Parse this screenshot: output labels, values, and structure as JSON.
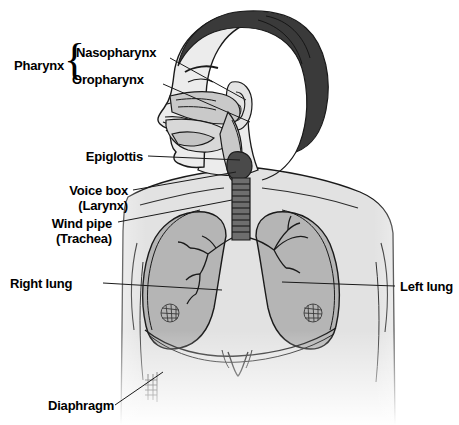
{
  "figure": {
    "background_color": "#ffffff",
    "ink_color": "#1a1a1a",
    "skin_color": "#e9e9e9",
    "hair_color": "#3a3a3a",
    "lung_color": "#b5b5b5",
    "airway_color": "#c9c9c9",
    "trachea_color": "#555555"
  },
  "labels": {
    "pharynx": "Pharynx",
    "nasopharynx": "Nasopharynx",
    "oropharynx": "Oropharynx",
    "epiglottis": "Epiglottis",
    "voice_box_line1": "Voice box",
    "voice_box_line2": "(Larynx)",
    "wind_pipe_line1": "Wind pipe",
    "wind_pipe_line2": "(Trachea)",
    "right_lung": "Right lung",
    "left_lung": "Left lung",
    "diaphragm": "Diaphragm",
    "brace_glyph": "{"
  },
  "parts": [
    {
      "name": "nasal-cavity",
      "label": "Nasopharynx"
    },
    {
      "name": "oral-cavity",
      "label": "Oropharynx"
    },
    {
      "name": "epiglottis",
      "label": "Epiglottis"
    },
    {
      "name": "larynx",
      "label": "Voice box (Larynx)"
    },
    {
      "name": "trachea",
      "label": "Wind pipe (Trachea)"
    },
    {
      "name": "right-lung",
      "label": "Right lung"
    },
    {
      "name": "left-lung",
      "label": "Left lung"
    },
    {
      "name": "diaphragm",
      "label": "Diaphragm"
    }
  ]
}
